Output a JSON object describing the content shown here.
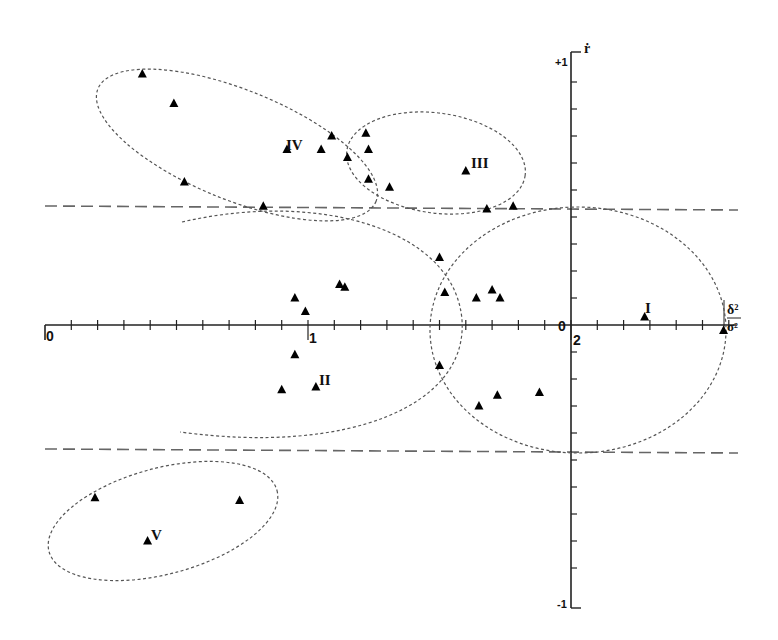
{
  "figure": {
    "x_axis": {
      "label_numerator": "δ²",
      "label_denominator": "σ²",
      "tick_labels": [
        "0",
        "1",
        "2"
      ],
      "range": [
        0,
        2.6
      ],
      "minor_tick_step": 0.1
    },
    "y_axis": {
      "label": "ṙ",
      "tick_labels": [
        "+1",
        "0",
        "-1"
      ],
      "range": [
        -1,
        1
      ],
      "minor_tick_step": 0.1
    },
    "threshold_lines": [
      {
        "y": 0.45,
        "style": "dashed"
      },
      {
        "y": -0.45,
        "style": "dashed"
      }
    ],
    "clusters": [
      {
        "id": "I",
        "label": "I"
      },
      {
        "id": "II",
        "label": "II"
      },
      {
        "id": "III",
        "label": "III"
      },
      {
        "id": "IV",
        "label": "IV"
      },
      {
        "id": "V",
        "label": "V"
      }
    ]
  },
  "chart_data": {
    "type": "scatter",
    "title": "",
    "xlabel": "δ²/σ²",
    "ylabel": "ṙ",
    "xlim": [
      0,
      2.6
    ],
    "ylim": [
      -1,
      1
    ],
    "marker": "triangle",
    "grid": false,
    "legend": "none",
    "horizontal_reference_lines": [
      0.45,
      -0.45
    ],
    "annotations": [
      "I",
      "II",
      "III",
      "IV",
      "V"
    ],
    "series": [
      {
        "name": "I",
        "points": [
          [
            2.28,
            0.03
          ],
          [
            2.58,
            -0.02
          ]
        ]
      },
      {
        "name": "II",
        "points": [
          [
            0.95,
            0.1
          ],
          [
            0.99,
            0.05
          ],
          [
            1.12,
            0.15
          ],
          [
            1.14,
            0.14
          ],
          [
            0.95,
            -0.11
          ],
          [
            0.9,
            -0.24
          ],
          [
            1.03,
            -0.23
          ]
        ]
      },
      {
        "name": "I/II overlap",
        "points": [
          [
            1.5,
            0.25
          ],
          [
            1.52,
            0.12
          ],
          [
            1.5,
            -0.15
          ],
          [
            1.64,
            0.1
          ],
          [
            1.7,
            0.13
          ],
          [
            1.73,
            0.1
          ],
          [
            1.65,
            -0.3
          ],
          [
            1.72,
            -0.26
          ],
          [
            1.88,
            -0.25
          ]
        ]
      },
      {
        "name": "III",
        "points": [
          [
            1.6,
            0.57
          ],
          [
            1.68,
            0.43
          ],
          [
            1.78,
            0.44
          ]
        ]
      },
      {
        "name": "IV",
        "points": [
          [
            0.37,
            0.93
          ],
          [
            0.49,
            0.82
          ],
          [
            0.53,
            0.53
          ],
          [
            0.92,
            0.65
          ],
          [
            1.05,
            0.65
          ],
          [
            1.09,
            0.7
          ],
          [
            1.15,
            0.62
          ],
          [
            1.22,
            0.71
          ],
          [
            1.23,
            0.65
          ],
          [
            1.23,
            0.54
          ],
          [
            1.31,
            0.51
          ],
          [
            0.83,
            0.44
          ]
        ]
      },
      {
        "name": "V",
        "points": [
          [
            0.19,
            -0.64
          ],
          [
            0.74,
            -0.65
          ],
          [
            0.39,
            -0.8
          ]
        ]
      }
    ],
    "cluster_ellipses": [
      {
        "name": "I",
        "center": [
          2.03,
          0.05
        ],
        "rx": 0.56,
        "ry": 0.46
      },
      {
        "name": "II",
        "center": [
          1.05,
          0.0
        ],
        "rx": 0.59,
        "ry": 0.44
      },
      {
        "name": "III",
        "center": [
          1.64,
          0.59
        ],
        "rx": 0.32,
        "ry": 0.19
      },
      {
        "name": "IV",
        "center": [
          0.84,
          0.67
        ],
        "rx": 0.55,
        "ry": 0.22,
        "rotation_deg": 20
      },
      {
        "name": "V",
        "center": [
          0.46,
          -0.73
        ],
        "rx": 0.45,
        "ry": 0.19,
        "rotation_deg": -15
      }
    ]
  }
}
